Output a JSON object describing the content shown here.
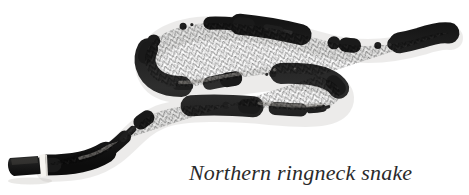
{
  "page": {
    "width": 469,
    "height": 195,
    "background_color": "#ffffff",
    "kind": "natural-history-illustration"
  },
  "caption": {
    "text": "Northern ringneck snake",
    "style": "italic-serif",
    "color": "#2a2a2a",
    "font_size_px": 22,
    "position": {
      "x": 189,
      "y": 158
    }
  },
  "subject": {
    "name": "Northern ringneck snake",
    "common_name": "Northern ringneck snake",
    "pose": "s-curve-coiled",
    "head": {
      "label": "head",
      "position": {
        "x": 22,
        "y": 164
      },
      "color": "#1c1c1c",
      "width_px": 30,
      "height_px": 15
    },
    "neck_ring": {
      "label": "neck-ring",
      "color": "#f2f0ec",
      "position": {
        "x": 42,
        "y": 157
      },
      "width_px": 4,
      "height_px": 18
    },
    "tail_tip": {
      "label": "tail-tip",
      "position": {
        "x": 449,
        "y": 33
      }
    },
    "body_color_dark": "#1a1a1a",
    "body_color_mid": "#343434",
    "body_highlight": "#9d9a94",
    "shadow_color": "#c9c6c1"
  },
  "colors": {
    "background": "#ffffff",
    "body_dark": "#1a1a1a",
    "body_mid": "#3a3a3a",
    "body_light": "#8e8b86",
    "ring": "#f5f3ef",
    "caption_ink": "#2a2a2a"
  }
}
